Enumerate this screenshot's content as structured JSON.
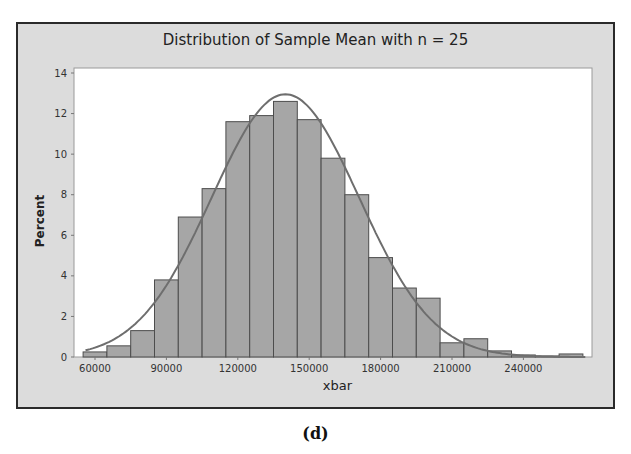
{
  "caption": "(d)",
  "chart_data": {
    "type": "bar",
    "title": "Distribution of Sample Mean with n = 25",
    "xlabel": "xbar",
    "ylabel": "Percent",
    "bin_width": 10000,
    "categories": [
      60000,
      70000,
      80000,
      90000,
      100000,
      110000,
      120000,
      130000,
      140000,
      150000,
      160000,
      170000,
      180000,
      190000,
      200000,
      210000,
      220000,
      230000,
      240000,
      250000,
      260000
    ],
    "values": [
      0.25,
      0.55,
      1.3,
      3.8,
      6.9,
      8.3,
      11.6,
      11.9,
      12.6,
      11.7,
      9.8,
      8.0,
      4.9,
      3.4,
      2.9,
      0.7,
      0.9,
      0.3,
      0.1,
      0.05,
      0.15
    ],
    "fit_curve": {
      "type": "normal",
      "mean": 140000,
      "peak_percent": 12.95
    },
    "x_ticks": [
      "60000",
      "90000",
      "120000",
      "150000",
      "180000",
      "210000",
      "240000"
    ],
    "y_ticks": [
      "0",
      "2",
      "4",
      "6",
      "8",
      "10",
      "12",
      "14"
    ],
    "ylim": [
      0,
      14
    ],
    "xlim": [
      55000,
      268000
    ],
    "grid": false,
    "legend": null,
    "colors": {
      "bar": "#a6a6a6",
      "bar_edge": "#4d4d4d",
      "curve": "#6e6e6e",
      "frame_bg": "#dcdcdc",
      "plot_bg": "#ffffff"
    }
  }
}
